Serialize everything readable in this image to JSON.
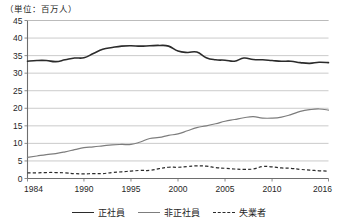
{
  "unit_note": "（単位：百万人）",
  "legend": {
    "items": [
      {
        "label": "正社員",
        "style": "solid-dark"
      },
      {
        "label": "非正社員",
        "style": "solid-gray"
      },
      {
        "label": "失業者",
        "style": "dashed-dark"
      }
    ]
  },
  "axis": {
    "y_ticks": [
      "0",
      "5",
      "10",
      "15",
      "20",
      "25",
      "30",
      "35",
      "40",
      "45"
    ],
    "x_ticks": [
      "1984",
      "1990",
      "1995",
      "2000",
      "2005",
      "2010",
      "2016"
    ]
  },
  "chart_data": {
    "type": "line",
    "title": "",
    "subtitle": "",
    "xlabel": "",
    "ylabel": "（単位：百万人）",
    "xlim": [
      1984,
      2016
    ],
    "ylim": [
      0,
      45
    ],
    "grid": true,
    "legend_position": "bottom",
    "x": [
      1984,
      1985,
      1986,
      1987,
      1988,
      1989,
      1990,
      1991,
      1992,
      1993,
      1994,
      1995,
      1996,
      1997,
      1998,
      1999,
      2000,
      2001,
      2002,
      2003,
      2004,
      2005,
      2006,
      2007,
      2008,
      2009,
      2010,
      2011,
      2012,
      2013,
      2014,
      2015,
      2016
    ],
    "series": [
      {
        "name": "正社員",
        "color": "#2b2b2b",
        "style": "solid",
        "values": [
          33.4,
          33.6,
          33.6,
          33.3,
          33.8,
          34.3,
          34.4,
          35.6,
          36.8,
          37.3,
          37.7,
          37.8,
          37.7,
          37.8,
          37.9,
          37.7,
          36.3,
          35.9,
          36.0,
          34.4,
          33.8,
          33.7,
          33.4,
          34.3,
          33.9,
          33.8,
          33.6,
          33.4,
          33.4,
          33.0,
          32.8,
          33.1,
          33.0
        ]
      },
      {
        "name": "非正社員",
        "color": "#7d7d7d",
        "style": "solid",
        "values": [
          6.0,
          6.4,
          6.8,
          7.1,
          7.6,
          8.2,
          8.8,
          9.0,
          9.3,
          9.6,
          9.7,
          9.7,
          10.4,
          11.4,
          11.7,
          12.3,
          12.7,
          13.6,
          14.5,
          15.0,
          15.6,
          16.3,
          16.8,
          17.3,
          17.6,
          17.2,
          17.2,
          17.5,
          18.2,
          19.1,
          19.6,
          19.8,
          19.5
        ]
      },
      {
        "name": "失業者",
        "color": "#2b2b2b",
        "style": "dashed",
        "values": [
          1.6,
          1.6,
          1.7,
          1.7,
          1.6,
          1.4,
          1.3,
          1.4,
          1.4,
          1.7,
          1.9,
          2.1,
          2.3,
          2.3,
          2.8,
          3.2,
          3.2,
          3.4,
          3.6,
          3.5,
          3.1,
          2.9,
          2.7,
          2.6,
          2.7,
          3.4,
          3.3,
          3.0,
          2.9,
          2.6,
          2.4,
          2.2,
          2.1
        ]
      }
    ]
  }
}
